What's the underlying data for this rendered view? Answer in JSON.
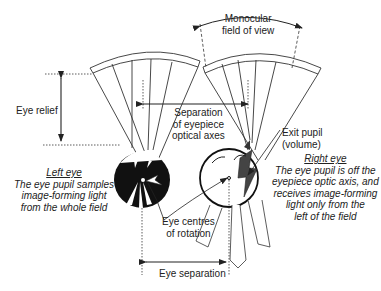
{
  "diagram": {
    "type": "binocular eyepiece optics schematic",
    "labels": {
      "monocular_fov": [
        "Monocular",
        "field of view"
      ],
      "eye_relief": "Eye relief",
      "separation_optical_axes": [
        "Separation",
        "of eyepiece",
        "optical axes"
      ],
      "exit_pupil": [
        "Exit pupil",
        "(volume)"
      ],
      "left_eye_title": "Left eye",
      "left_eye_desc": [
        "The eye pupil samples",
        "image-forming light",
        "from the whole field"
      ],
      "right_eye_title": "Right eye",
      "right_eye_desc": [
        "The eye pupil is off the",
        "eyepiece optic axis, and",
        "receives image-forming",
        "light only from the",
        "left of the field"
      ],
      "eye_centres": [
        "Eye centres",
        "of rotation"
      ],
      "eye_separation": "Eye separation"
    },
    "elements": [
      {
        "id": "left-eyepiece-lens",
        "kind": "curved lens"
      },
      {
        "id": "right-eyepiece-lens",
        "kind": "curved lens"
      },
      {
        "id": "left-eye",
        "kind": "eyeball",
        "pupil": "centred",
        "fill": "#111111"
      },
      {
        "id": "right-eye",
        "kind": "eyeball",
        "pupil": "off-axis",
        "fill": "#ffffff",
        "pupil_fill": "#444444"
      }
    ],
    "colors": {
      "line": "#333333",
      "dark": "#111111",
      "pupil_gray": "#444444",
      "background": "#ffffff"
    }
  }
}
